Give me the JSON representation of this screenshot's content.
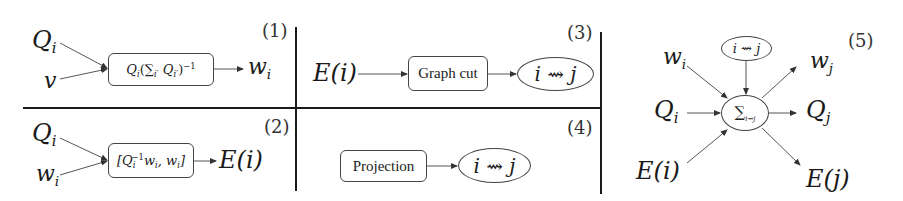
{
  "diagram": {
    "panels": [
      {
        "id": "1",
        "number_label": "(1)",
        "inputs": [
          "Q",
          "v"
        ],
        "input_subscripts": [
          "i",
          ""
        ],
        "operation": {
          "type": "box",
          "label_main": "Q",
          "label_sub": "i",
          "label_rest": "(∑",
          "label_sum_sub": "i′",
          "label_q": " Q",
          "label_q_sub": "i′",
          "label_close": ")",
          "label_sup": "−1"
        },
        "output": {
          "base": "w",
          "sub": "i"
        }
      },
      {
        "id": "2",
        "number_label": "(2)",
        "inputs": [
          "Q",
          "w"
        ],
        "input_subscripts": [
          "i",
          "i"
        ],
        "operation": {
          "type": "box",
          "open": "[Q",
          "sub1": "i",
          "sup1": "−1",
          "mid": "w",
          "sub2": "i",
          "comma": ", w",
          "sub3": "i",
          "close": "]"
        },
        "output": {
          "label": "E(i)"
        }
      },
      {
        "id": "3",
        "number_label": "(3)",
        "input": "E(i)",
        "operation": {
          "type": "box",
          "label": "Graph cut"
        },
        "output": {
          "type": "ellipse",
          "label": "i ⇝ j"
        }
      },
      {
        "id": "4",
        "number_label": "(4)",
        "operation": {
          "type": "box",
          "label": "Projection"
        },
        "output": {
          "type": "ellipse",
          "label": "i ⇝ j"
        }
      },
      {
        "id": "5",
        "number_label": "(5)",
        "top_node": {
          "type": "ellipse",
          "label": "i ⇝ j"
        },
        "center_node": {
          "type": "ellipse",
          "label_main": "∑",
          "label_sub": "i⇝j"
        },
        "inputs": [
          {
            "base": "w",
            "sub": "i"
          },
          {
            "base": "Q",
            "sub": "i"
          },
          {
            "label": "E(i)"
          }
        ],
        "outputs": [
          {
            "base": "w",
            "sub": "j"
          },
          {
            "base": "Q",
            "sub": "j"
          },
          {
            "label": "E(j)"
          }
        ]
      }
    ],
    "colors": {
      "line": "#444444",
      "divider": "#1a1a1a",
      "text": "#1a1a1a",
      "background": "#ffffff"
    }
  }
}
